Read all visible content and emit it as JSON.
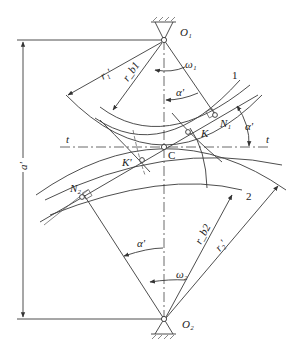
{
  "diagram": {
    "labels": {
      "O1": "O₁",
      "O2": "O₂",
      "omega1": "ω₁",
      "omega2": "ω₂",
      "alpha_top": "α'",
      "alpha_right": "α'",
      "alpha_bottom": "α'",
      "r1p": "r₁'",
      "rb1": "r_b1",
      "r2p": "r₂'",
      "rb2": "r_b2",
      "a_prime": "a'",
      "t_left": "t",
      "t_right": "t",
      "C": "C",
      "K": "K",
      "Kp": "K'",
      "N1": "N₁",
      "N2": "N₂",
      "gear1": "1",
      "gear2": "2"
    }
  }
}
